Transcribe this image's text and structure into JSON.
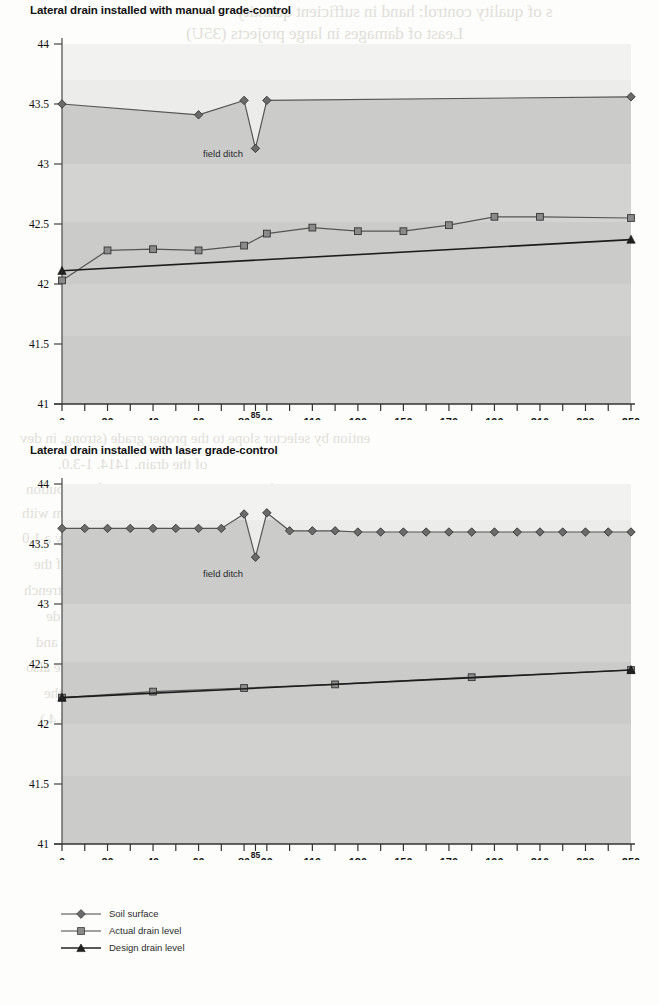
{
  "page": {
    "background_color": "#fdfdfb",
    "bleed_through_lines": [
      {
        "text": "s of quality control: hand in sufficient quantity",
        "x": 236,
        "y": 2,
        "size": 17
      },
      {
        "text": "Least of damages in large projects (35U)",
        "x": 186,
        "y": 24,
        "size": 17
      },
      {
        "text": "Cost of enced use  Intensity of",
        "x": 236,
        "y": 52,
        "size": 17
      },
      {
        "text": "installation",
        "x": 318,
        "y": 168,
        "size": 15
      },
      {
        "text": "trade",
        "x": 232,
        "y": 248,
        "size": 15
      },
      {
        "text": "of visual quality control or machinery",
        "x": 216,
        "y": 272,
        "size": 15
      },
      {
        "text": "ention by selector slope to the proper  grade (strong, in dev",
        "x": 20,
        "y": 430,
        "size": 15
      },
      {
        "text": "of the drain. 1414. 1-3.0.",
        "x": 58,
        "y": 456,
        "size": 15
      },
      {
        "text": "the installation by use of a gage to control the type of distribution",
        "x": 26,
        "y": 481,
        "size": 15
      },
      {
        "text": "ed drain or of drainage in mm of 0.5-1.0 m depth. Laser beam with",
        "x": 22,
        "y": 505,
        "size": 15
      },
      {
        "text": "a laser equipped trencher with a remote control unit can only a 1.0",
        "x": 22,
        "y": 530,
        "size": 15
      },
      {
        "text": "coverage of excavating work and to control the grade of the",
        "x": 34,
        "y": 556,
        "size": 15
      },
      {
        "text": "s of the automatic machine. O-state 5.17. The basic trench",
        "x": 24,
        "y": 582,
        "size": 15
      },
      {
        "text": "e slope of the trench to a drilling within the 1 m de",
        "x": 46,
        "y": 608,
        "size": 15
      },
      {
        "text": "in such a way that it automatically gives the level and",
        "x": 36,
        "y": 634,
        "size": 15
      },
      {
        "text": "slope at the intersection in the level markets. There are also",
        "x": 26,
        "y": 659,
        "size": 15
      },
      {
        "text": "s in laser position. Depth of the drain can also be the",
        "x": 44,
        "y": 685,
        "size": 15
      },
      {
        "text": "trench, approved the quality of installation. (Plate 5.4.)",
        "x": 40,
        "y": 711,
        "size": 15
      }
    ]
  },
  "chart_data": [
    {
      "type": "line",
      "title": "Lateral drain installed with manual grade-control",
      "xlabel": "",
      "ylabel": "",
      "xlim": [
        0,
        250
      ],
      "ylim": [
        41,
        44
      ],
      "yticks": [
        "44",
        "43.5",
        "43",
        "42.5",
        "42",
        "41.5",
        "41"
      ],
      "ytick_values": [
        44,
        43.5,
        43,
        42.5,
        42,
        41.5,
        41
      ],
      "xticks": [
        "0",
        "20",
        "40",
        "60",
        "80",
        "85",
        "90",
        "110",
        "130",
        "150",
        "170",
        "190",
        "210",
        "230",
        "250"
      ],
      "xtick_values": [
        0,
        20,
        40,
        60,
        80,
        85,
        90,
        110,
        130,
        150,
        170,
        190,
        210,
        230,
        250
      ],
      "minor_xticks": [
        10,
        30,
        50,
        70,
        100,
        120,
        140,
        160,
        180,
        200,
        220,
        240
      ],
      "grid": false,
      "annotations": [
        {
          "text": "field ditch",
          "x": 95,
          "y": 43.02
        }
      ],
      "legend_position": "below-figure",
      "series": [
        {
          "name": "Soil surface",
          "marker": "diamond",
          "color": "#6b6b6b",
          "x": [
            0,
            60,
            80,
            85,
            90,
            250
          ],
          "values": [
            43.5,
            43.41,
            43.53,
            43.13,
            43.53,
            43.56
          ]
        },
        {
          "name": "Actual drain level",
          "marker": "square",
          "color": "#8a8a8a",
          "x": [
            0,
            20,
            40,
            60,
            80,
            90,
            110,
            130,
            150,
            170,
            190,
            210,
            250
          ],
          "values": [
            42.03,
            42.28,
            42.29,
            42.28,
            42.32,
            42.42,
            42.47,
            42.44,
            42.44,
            42.49,
            42.56,
            42.56,
            42.55
          ]
        },
        {
          "name": "Design drain level",
          "marker": "triangle",
          "color": "#222222",
          "x": [
            0,
            250
          ],
          "values": [
            42.11,
            42.37
          ]
        }
      ]
    },
    {
      "type": "line",
      "title": "Lateral drain installed with laser grade-control",
      "xlabel": "",
      "ylabel": "",
      "xlim": [
        0,
        250
      ],
      "ylim": [
        41,
        44
      ],
      "yticks": [
        "44",
        "43.5",
        "43",
        "42.5",
        "42",
        "41.5",
        "41"
      ],
      "ytick_values": [
        44,
        43.5,
        43,
        42.5,
        42,
        41.5,
        41
      ],
      "xticks": [
        "0",
        "20",
        "40",
        "60",
        "80",
        "85",
        "90",
        "110",
        "130",
        "150",
        "170",
        "190",
        "210",
        "230",
        "250"
      ],
      "xtick_values": [
        0,
        20,
        40,
        60,
        80,
        85,
        90,
        110,
        130,
        150,
        170,
        190,
        210,
        230,
        250
      ],
      "minor_xticks": [
        10,
        30,
        50,
        70,
        100,
        120,
        140,
        160,
        180,
        200,
        220,
        240
      ],
      "grid": false,
      "annotations": [
        {
          "text": "field ditch",
          "x": 95,
          "y": 43.2
        }
      ],
      "legend_position": "below-figure",
      "series": [
        {
          "name": "Soil surface",
          "marker": "diamond",
          "color": "#6b6b6b",
          "x": [
            0,
            10,
            20,
            30,
            40,
            50,
            60,
            70,
            80,
            85,
            90,
            100,
            110,
            120,
            130,
            140,
            150,
            160,
            170,
            180,
            190,
            200,
            210,
            220,
            230,
            240,
            250
          ],
          "values": [
            43.63,
            43.63,
            43.63,
            43.63,
            43.63,
            43.63,
            43.63,
            43.63,
            43.75,
            43.39,
            43.76,
            43.61,
            43.61,
            43.61,
            43.6,
            43.6,
            43.6,
            43.6,
            43.6,
            43.6,
            43.6,
            43.6,
            43.6,
            43.6,
            43.6,
            43.6,
            43.6
          ]
        },
        {
          "name": "Actual drain level",
          "marker": "square",
          "color": "#8a8a8a",
          "x": [
            0,
            40,
            80,
            120,
            180,
            250
          ],
          "values": [
            42.22,
            42.27,
            42.3,
            42.33,
            42.39,
            42.45
          ]
        },
        {
          "name": "Design drain level",
          "marker": "triangle",
          "color": "#222222",
          "x": [
            0,
            250
          ],
          "values": [
            42.22,
            42.45
          ]
        }
      ]
    }
  ],
  "legend": {
    "items": [
      {
        "label": "Soil surface",
        "marker": "diamond"
      },
      {
        "label": "Actual drain level",
        "marker": "square"
      },
      {
        "label": "Design drain level",
        "marker": "triangle"
      }
    ]
  }
}
